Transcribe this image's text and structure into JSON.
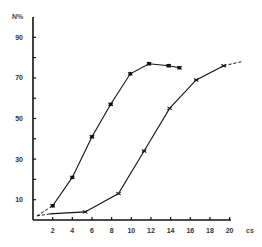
{
  "chart_data": {
    "type": "line",
    "title": "",
    "xlabel": "cs",
    "ylabel": "N%",
    "xlim": [
      0,
      21
    ],
    "ylim": [
      0,
      100
    ],
    "x_ticks": [
      2,
      4,
      6,
      8,
      10,
      12,
      14,
      16,
      18,
      20
    ],
    "y_ticks": [
      10,
      30,
      50,
      70,
      90
    ],
    "y_minor_ticks": [
      20,
      40,
      60,
      80
    ],
    "grid": false,
    "legend": null,
    "series": [
      {
        "name": "curve-left",
        "dashed_start": [
          [
            0.4,
            2
          ],
          [
            2,
            7
          ]
        ],
        "points": [
          [
            2,
            7
          ],
          [
            4,
            21
          ],
          [
            6,
            41
          ],
          [
            7.9,
            57
          ],
          [
            9.9,
            72
          ],
          [
            11.8,
            77
          ],
          [
            13.8,
            76
          ],
          [
            14.9,
            75
          ]
        ]
      },
      {
        "name": "curve-right",
        "dashed_start": [
          [
            0.4,
            2
          ],
          [
            1.7,
            3
          ]
        ],
        "points": [
          [
            1.7,
            3
          ],
          [
            5.3,
            4
          ],
          [
            8.7,
            13
          ],
          [
            11.3,
            34
          ],
          [
            13.9,
            55
          ],
          [
            16.6,
            69
          ],
          [
            19.4,
            76
          ]
        ],
        "dashed_end": [
          [
            19.4,
            76
          ],
          [
            21.2,
            78
          ]
        ]
      }
    ]
  }
}
